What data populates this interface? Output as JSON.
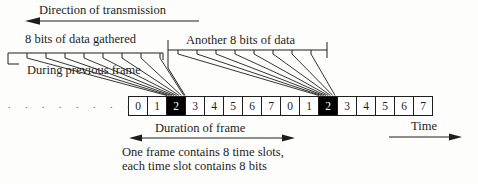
{
  "colors": {
    "ink": "#1e1e1e",
    "highlight_slot_bg": "#000000",
    "highlight_slot_text": "#ffffff",
    "normal_slot_bg": "#ffffff"
  },
  "top": {
    "direction_label": "Direction of transmission"
  },
  "rulers": {
    "left": {
      "label": "8 bits of data gathered",
      "sublabel": "During previous frame",
      "bit_tick_count": 8
    },
    "right": {
      "label": "Another 8 bits of data",
      "bit_tick_count": 8
    }
  },
  "slot_row": {
    "leading_dots": ". . . . . . . .",
    "cells": [
      {
        "label": "0",
        "highlighted": false
      },
      {
        "label": "1",
        "highlighted": false
      },
      {
        "label": "2",
        "highlighted": true
      },
      {
        "label": "3",
        "highlighted": false
      },
      {
        "label": "4",
        "highlighted": false
      },
      {
        "label": "5",
        "highlighted": false
      },
      {
        "label": "6",
        "highlighted": false
      },
      {
        "label": "7",
        "highlighted": false
      },
      {
        "label": "0",
        "highlighted": false
      },
      {
        "label": "1",
        "highlighted": false
      },
      {
        "label": "2",
        "highlighted": true
      },
      {
        "label": "3",
        "highlighted": false
      },
      {
        "label": "4",
        "highlighted": false
      },
      {
        "label": "5",
        "highlighted": false
      },
      {
        "label": "6",
        "highlighted": false
      },
      {
        "label": "7",
        "highlighted": false
      }
    ]
  },
  "footer": {
    "duration_label": "Duration of frame",
    "time_label": "Time",
    "caption_line1": "One frame contains 8 time slots,",
    "caption_line2": "each time slot contains 8 bits"
  }
}
